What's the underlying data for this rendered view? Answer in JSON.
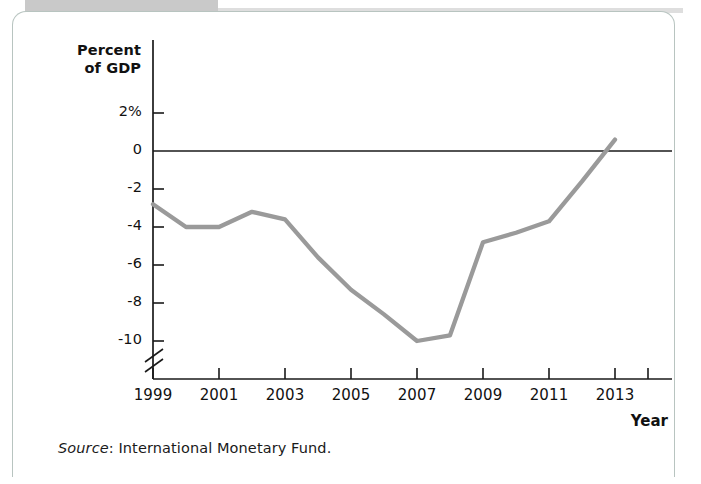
{
  "figure": {
    "y_axis_title_line1": "Percent",
    "y_axis_title_line2": "of GDP",
    "x_axis_title": "Year",
    "source_label": "Source",
    "source_separator": ": ",
    "source_text": "International Monetary Fund.",
    "line_color": "#9a9a9a",
    "axis_color": "#1a1a1a",
    "card_border_color": "#b8c4c0",
    "tab_color": "#c9c9c9"
  },
  "chart_data": {
    "type": "line",
    "title": "",
    "xlabel": "Year",
    "ylabel": "Percent of GDP",
    "ylim": [
      -11,
      2.6
    ],
    "xlim": [
      1999,
      2014
    ],
    "grid": false,
    "legend": "none",
    "axis_break": true,
    "zero_line": true,
    "ytick_labels": [
      "2%",
      "0",
      "-2",
      "-4",
      "-6",
      "-8",
      "-10"
    ],
    "yticks": [
      2,
      0,
      -2,
      -4,
      -6,
      -8,
      -10
    ],
    "xtick_labels": [
      "1999",
      "2001",
      "2003",
      "2005",
      "2007",
      "2009",
      "2011",
      "2013"
    ],
    "xticks": [
      1999,
      2001,
      2003,
      2005,
      2007,
      2009,
      2011,
      2013
    ],
    "x": [
      1999,
      2000,
      2001,
      2002,
      2003,
      2004,
      2005,
      2006,
      2007,
      2008,
      2009,
      2010,
      2011,
      2012,
      2013
    ],
    "series": [
      {
        "name": "Greek budget balance",
        "values": [
          -2.8,
          -4.0,
          -4.0,
          -3.2,
          -3.6,
          -5.6,
          -7.3,
          -8.6,
          -10.0,
          -9.7,
          -4.8,
          -4.3,
          -3.7,
          -1.6,
          0.6
        ]
      }
    ]
  }
}
